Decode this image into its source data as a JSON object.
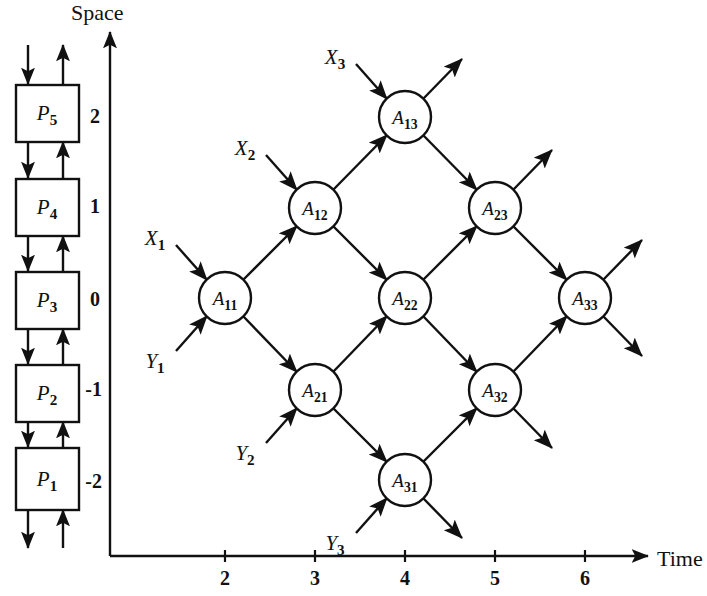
{
  "figure": {
    "background": "#ffffff",
    "ink": "#111111",
    "axes": {
      "y_axis_label": "Space",
      "x_axis_label": "Time",
      "y_ticks": [
        "2",
        "1",
        "0",
        "-1",
        "-2"
      ],
      "x_ticks": [
        "2",
        "3",
        "4",
        "5",
        "6"
      ]
    }
  },
  "processor_stack": {
    "name": "processor-array",
    "boxes": [
      {
        "label": "P5",
        "space": "2"
      },
      {
        "label": "P4",
        "space": "1"
      },
      {
        "label": "P3",
        "space": "0"
      },
      {
        "label": "P2",
        "space": "-1"
      },
      {
        "label": "P1",
        "space": "-2"
      }
    ]
  },
  "dependency_graph": {
    "nodes": [
      {
        "id": "A11",
        "label": "A11",
        "sub": "11",
        "time": 2,
        "space": 0,
        "cx": 225,
        "cy": 298
      },
      {
        "id": "A12",
        "label": "A12",
        "sub": "12",
        "time": 3,
        "space": 1,
        "cx": 315,
        "cy": 208
      },
      {
        "id": "A13",
        "label": "A13",
        "sub": "13",
        "time": 4,
        "space": 2,
        "cx": 405,
        "cy": 117
      },
      {
        "id": "A21",
        "label": "A21",
        "sub": "21",
        "time": 3,
        "space": -1,
        "cx": 315,
        "cy": 390
      },
      {
        "id": "A22",
        "label": "A22",
        "sub": "22",
        "time": 4,
        "space": 0,
        "cx": 405,
        "cy": 298
      },
      {
        "id": "A23",
        "label": "A23",
        "sub": "23",
        "time": 5,
        "space": 1,
        "cx": 495,
        "cy": 208
      },
      {
        "id": "A31",
        "label": "A31",
        "sub": "31",
        "time": 4,
        "space": -2,
        "cx": 405,
        "cy": 480
      },
      {
        "id": "A32",
        "label": "A32",
        "sub": "32",
        "time": 5,
        "space": -1,
        "cx": 495,
        "cy": 390
      },
      {
        "id": "A33",
        "label": "A33",
        "sub": "33",
        "time": 6,
        "space": 0,
        "cx": 585,
        "cy": 298
      }
    ],
    "inputs_x": [
      {
        "label": "X1",
        "sub": "1",
        "x": 155,
        "y": 238,
        "target": "A11"
      },
      {
        "label": "X2",
        "sub": "2",
        "x": 245,
        "y": 148,
        "target": "A12"
      },
      {
        "label": "X3",
        "sub": "3",
        "x": 335,
        "y": 57,
        "target": "A13"
      }
    ],
    "inputs_y": [
      {
        "label": "Y1",
        "sub": "1",
        "x": 155,
        "y": 360,
        "target": "A11"
      },
      {
        "label": "Y2",
        "sub": "2",
        "x": 245,
        "y": 452,
        "target": "A21"
      },
      {
        "label": "Y3",
        "sub": "3",
        "x": 335,
        "y": 542,
        "target": "A31"
      }
    ]
  },
  "chart_data": {
    "type": "scatter",
    "title": "",
    "xlabel": "Time",
    "ylabel": "Space",
    "xlim": [
      1,
      6.8
    ],
    "ylim": [
      -2.6,
      2.6
    ],
    "xtick_values": [
      2,
      3,
      4,
      5,
      6
    ],
    "ytick_values": [
      2,
      1,
      0,
      -1,
      -2
    ],
    "grid": false,
    "legend": "none",
    "points": [
      {
        "name": "A11",
        "x": 2,
        "y": 0
      },
      {
        "name": "A12",
        "x": 3,
        "y": 1
      },
      {
        "name": "A13",
        "x": 4,
        "y": 2
      },
      {
        "name": "A21",
        "x": 3,
        "y": -1
      },
      {
        "name": "A22",
        "x": 4,
        "y": 0
      },
      {
        "name": "A23",
        "x": 5,
        "y": 1
      },
      {
        "name": "A31",
        "x": 4,
        "y": -2
      },
      {
        "name": "A32",
        "x": 5,
        "y": -1
      },
      {
        "name": "A33",
        "x": 6,
        "y": 0
      }
    ],
    "edges": [
      [
        "A11",
        "A12"
      ],
      [
        "A12",
        "A13"
      ],
      [
        "A11",
        "A21"
      ],
      [
        "A21",
        "A31"
      ],
      [
        "A12",
        "A22"
      ],
      [
        "A21",
        "A22"
      ],
      [
        "A22",
        "A23"
      ],
      [
        "A22",
        "A32"
      ],
      [
        "A13",
        "A23"
      ],
      [
        "A31",
        "A32"
      ],
      [
        "A23",
        "A33"
      ],
      [
        "A32",
        "A33"
      ]
    ],
    "annotations": [
      "X1",
      "X2",
      "X3",
      "Y1",
      "Y2",
      "Y3"
    ]
  }
}
